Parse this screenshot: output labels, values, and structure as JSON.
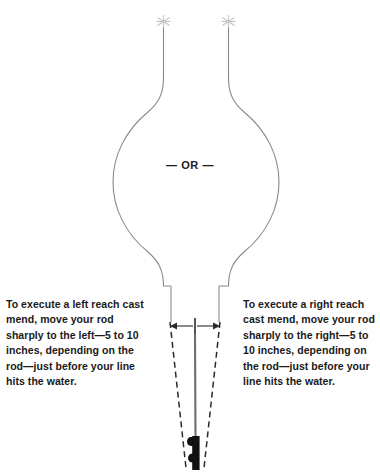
{
  "figure": {
    "center_divider_label": "— OR —",
    "colors": {
      "line": "#8a8a8a",
      "dashed_line": "#2b2b2b",
      "rod": "#6e6e6e",
      "rod_handle": "#111111",
      "arrow": "#2b2b2b",
      "text": "#1a1a1a",
      "background": "#ffffff",
      "star_marker": "#c9c9c9"
    },
    "markers": {
      "left_star": "✳",
      "right_star": "✳",
      "marker_name": "asterisk-target-marker"
    },
    "annotations": {
      "measure_arrow_left": "left-arrow",
      "measure_arrow_right": "right-arrow",
      "measure_center_tick": "center-tick"
    }
  },
  "captions": {
    "left": {
      "name": "left-reach-cast-caption",
      "text": "To execute a left reach cast mend, move your rod sharply to the left—5 to 10 inches, depending on the rod—just before your line hits the water."
    },
    "right": {
      "name": "right-reach-cast-caption",
      "text": "To execute a right reach cast mend, move your rod sharply to the right—5 to 10 inches, depending on the rod—just before your line hits the water."
    }
  }
}
